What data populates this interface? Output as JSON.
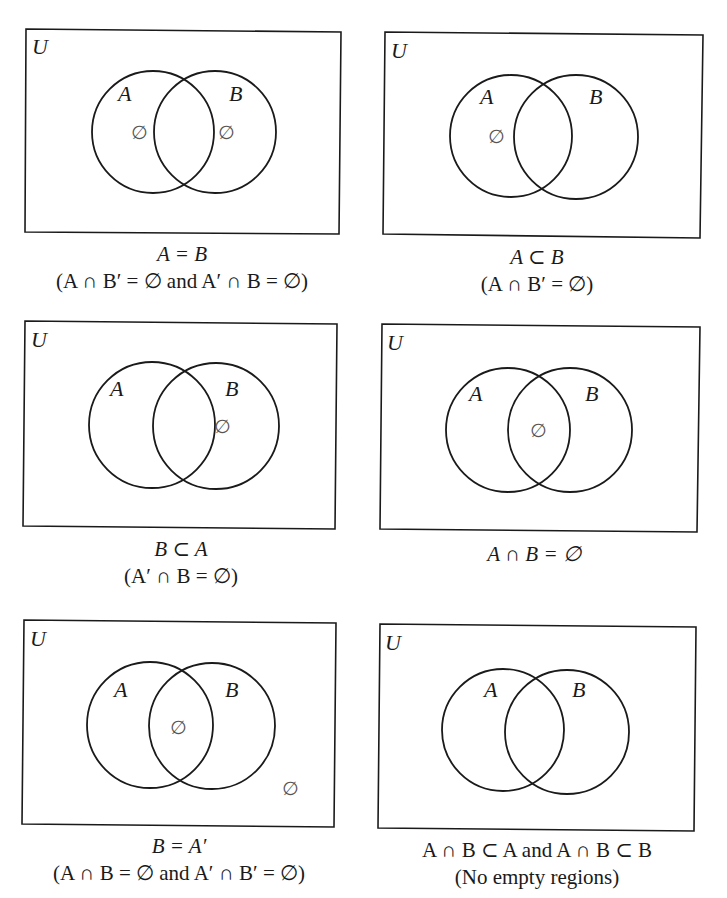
{
  "figure": {
    "universe_label": "U",
    "set_a_label": "A",
    "set_b_label": "B",
    "empty_symbol": "∅",
    "panels": [
      {
        "id": "a-equals-b",
        "caption_line1": "A = B",
        "caption_line2": "(A ∩ B′ = ∅ and A′ ∩ B = ∅)",
        "empty_regions": [
          "A only",
          "B only"
        ]
      },
      {
        "id": "a-subset-b",
        "caption_line1": "A ⊂ B",
        "caption_line2": "(A ∩ B′ = ∅)",
        "empty_regions": [
          "A only"
        ]
      },
      {
        "id": "b-subset-a",
        "caption_line1": "B ⊂ A",
        "caption_line2": "(A′ ∩ B = ∅)",
        "empty_regions": [
          "B only"
        ]
      },
      {
        "id": "disjoint",
        "caption_line1": "A ∩ B = ∅",
        "caption_line2": "",
        "empty_regions": [
          "A ∩ B"
        ]
      },
      {
        "id": "b-equals-a-complement",
        "caption_line1": "B = A′",
        "caption_line2": "(A ∩ B = ∅ and A′ ∩ B′ = ∅)",
        "empty_regions": [
          "A ∩ B",
          "outside both"
        ]
      },
      {
        "id": "no-empty-regions",
        "caption_line1": "A ∩ B ⊂ A and A ∩ B ⊂ B",
        "caption_line2": "(No empty regions)",
        "empty_regions": []
      }
    ]
  }
}
